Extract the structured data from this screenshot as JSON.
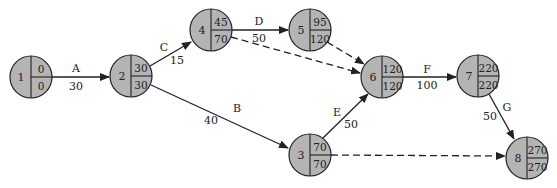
{
  "diagram": {
    "type": "activity-on-arrow network",
    "nodes": [
      {
        "id": "1",
        "es": "0",
        "ls": "0",
        "x": 31,
        "y": 77
      },
      {
        "id": "2",
        "es": "30",
        "ls": "30",
        "x": 131,
        "y": 76
      },
      {
        "id": "3",
        "es": "70",
        "ls": "70",
        "x": 310,
        "y": 155
      },
      {
        "id": "4",
        "es": "45",
        "ls": "70",
        "x": 211,
        "y": 30
      },
      {
        "id": "5",
        "es": "95",
        "ls": "120",
        "x": 310,
        "y": 30
      },
      {
        "id": "6",
        "es": "120",
        "ls": "120",
        "x": 382,
        "y": 77
      },
      {
        "id": "7",
        "es": "220",
        "ls": "220",
        "x": 478,
        "y": 76
      },
      {
        "id": "8",
        "es": "270",
        "ls": "270",
        "x": 527,
        "y": 158
      }
    ],
    "activities": [
      {
        "name": "A",
        "duration": "30",
        "from": "1",
        "to": "2"
      },
      {
        "name": "B",
        "duration": "40",
        "from": "2",
        "to": "3"
      },
      {
        "name": "C",
        "duration": "15",
        "from": "2",
        "to": "4"
      },
      {
        "name": "D",
        "duration": "50",
        "from": "4",
        "to": "5"
      },
      {
        "name": "E",
        "duration": "50",
        "from": "3",
        "to": "6"
      },
      {
        "name": "F",
        "duration": "100",
        "from": "6",
        "to": "7"
      },
      {
        "name": "G",
        "duration": "50",
        "from": "7",
        "to": "8"
      }
    ],
    "dummy_activities": [
      {
        "from": "4",
        "to": "6"
      },
      {
        "from": "5",
        "to": "6"
      },
      {
        "from": "3",
        "to": "8"
      }
    ]
  }
}
